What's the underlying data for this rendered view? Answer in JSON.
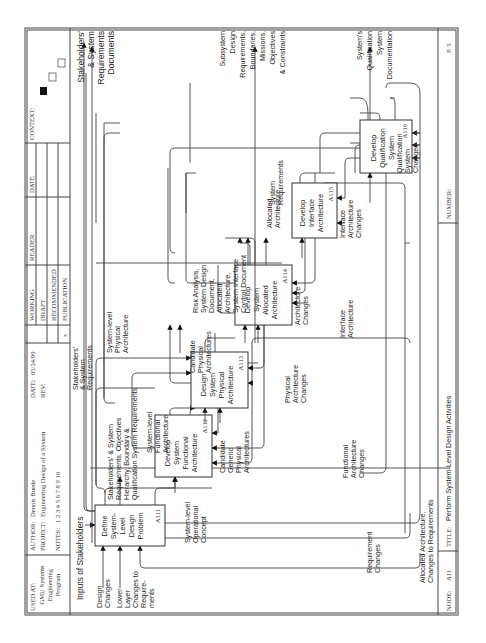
{
  "header": {
    "used_at_label": "USED AT:",
    "used_at_value": [
      "GMU Systems",
      "Engineering",
      "Program"
    ],
    "author_label": "AUTHOR:",
    "author_value": "Dennis Buede",
    "project_label": "PROJECT:",
    "project_value": "Engineering Design of a System",
    "notes_label": "NOTES:",
    "notes_value": "1 2 3 4 5 6 7 8 9 10",
    "date_label": "DATE:",
    "date_value": "05/24/99",
    "rev_label": "REV:",
    "status": [
      "WORKING",
      "DRAFT",
      "RECOMMENDED",
      "PUBLICATION"
    ],
    "status_mark": "x",
    "reader_label": "READER",
    "date_col_label": "DATE",
    "context_label": "CONTEXT:"
  },
  "footer": {
    "node_label": "NODE:",
    "node_value": "A11",
    "title_label": "TITLE:",
    "title_value": "Perform System-Level Design  Activities",
    "number_label": "NUMBER:",
    "page": "P. 5"
  },
  "boxes": [
    {
      "id": "A111",
      "lines": [
        "Define",
        "System-",
        "Level",
        "Design",
        "Problem"
      ]
    },
    {
      "id": "A112",
      "lines": [
        "Develop",
        "System",
        "Functional",
        "Architecture"
      ]
    },
    {
      "id": "A113",
      "lines": [
        "Design",
        "System",
        "Physical",
        "Architecture"
      ]
    },
    {
      "id": "A114",
      "lines": [
        "Develop",
        "System",
        "Allocated",
        "Architecture"
      ]
    },
    {
      "id": "A115",
      "lines": [
        "Develop",
        "Interface",
        "Architecture"
      ]
    },
    {
      "id": "A116",
      "lines": [
        "Develop",
        "Qualification",
        "System"
      ]
    }
  ],
  "labels": {
    "inputs_of_stakeholders": "Inputs of Stakeholders",
    "design_changes": [
      "Design",
      "Changes"
    ],
    "lower_layer": [
      "Lower",
      "Layer",
      "Changes to",
      "Require-",
      "ments"
    ],
    "stake_sys_req_top": [
      "Stakeholders'",
      "& System",
      "Requirements"
    ],
    "stake_hierarchy": [
      "Stakeholders' & System",
      "Requirements, Objectives",
      "Hierarchy, Boundary &",
      "Qualification System Requirements"
    ],
    "sys_func_arch": [
      "System-level",
      "Functional",
      "Architecture"
    ],
    "sys_phys_arch": [
      "System-level",
      "Physical",
      "Architecture"
    ],
    "cand_phys_arch": [
      "Candidate",
      "Physical",
      "Architectures"
    ],
    "cand_generic": [
      "Candidate",
      "Generic",
      "Physical",
      "Architectures"
    ],
    "risk_analysis": [
      "Risk Analysis,",
      "System Design",
      "Document,",
      "Allocated",
      "Architecture,",
      "System Interface",
      "Control Document"
    ],
    "allocated_arch": [
      "Allocated",
      "Architecture"
    ],
    "system_requirements": [
      "System",
      "Requirements"
    ],
    "arch_changes": [
      "Architecture",
      "Changes"
    ],
    "interface_arch": [
      "Interface",
      "Architecture"
    ],
    "interface_arch_changes": [
      "Interface",
      "Architecture",
      "Changes"
    ],
    "qual_sys_changes": [
      "Qualification",
      "System",
      "Changes"
    ],
    "phys_arch_changes": [
      "Physical",
      "Architecture",
      "Changes"
    ],
    "func_arch_changes": [
      "Functional",
      "Architecture",
      "Changes"
    ],
    "sys_op_concept": [
      "System-level",
      "Operational",
      "Concept"
    ],
    "req_changes": [
      "Requirement",
      "Changes"
    ],
    "alloc_changes_req": [
      "Allocated Architecture,",
      "Changes to Requirements"
    ],
    "out_stake_docs": [
      "Stakeholders'",
      "& System",
      "Requirements",
      "Documents"
    ],
    "out_subsystem": [
      "Subsystem",
      "Design",
      "Requirements,",
      "Boundaries,",
      "Missions,",
      "Objectives",
      "& Constraints"
    ],
    "out_qual_doc": [
      "System's",
      "Qualification",
      "System",
      "Documentation"
    ]
  }
}
